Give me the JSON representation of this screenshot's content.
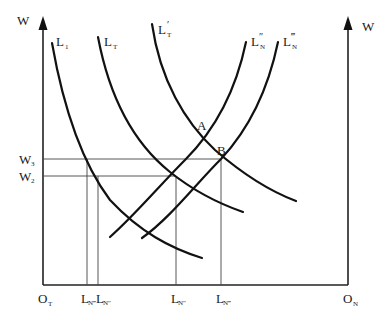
{
  "diagram": {
    "left_axis": {
      "label": "W",
      "origin_label": "O",
      "origin_sub": "T"
    },
    "right_axis": {
      "label": "W",
      "origin_label": "O",
      "origin_sub": "N"
    },
    "curves": [
      {
        "id": "L1",
        "label": "L",
        "sub": "1",
        "prime": ""
      },
      {
        "id": "LT",
        "label": "L",
        "sub": "T",
        "prime": ""
      },
      {
        "id": "LT_prime",
        "label": "L",
        "sub": "T",
        "prime": "′"
      },
      {
        "id": "LN_dprime",
        "label": "L",
        "sub": "N",
        "prime": "″"
      },
      {
        "id": "LN_tprime",
        "label": "L",
        "sub": "N",
        "prime": "‴"
      }
    ],
    "points": [
      {
        "label": "A"
      },
      {
        "label": "B"
      }
    ],
    "wage_levels": [
      {
        "label": "W",
        "sub": "3"
      },
      {
        "label": "W",
        "sub": "2"
      }
    ],
    "x_ticks": [
      {
        "label": "L",
        "sub": "N‴"
      },
      {
        "label": "L",
        "sub": "N″"
      },
      {
        "label": "L",
        "sub": "N″"
      },
      {
        "label": "L",
        "sub": "N‴"
      }
    ]
  }
}
